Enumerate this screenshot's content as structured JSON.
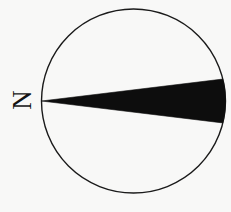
{
  "figure": {
    "kind": "rose-diagram",
    "background_color": "#f8f8f7",
    "stroke_color": "#1a1a1a",
    "fill_color": "#0d0d0d",
    "width": 231,
    "height": 212
  },
  "labels": {
    "north": "N"
  },
  "chart_data": {
    "type": "pie",
    "title": "",
    "subtitle": "",
    "xlabel": "",
    "ylabel": "",
    "legend": [],
    "grid": false,
    "circle": {
      "center_x": 133.5,
      "center_y": 101,
      "radius": 92,
      "stroke_width": 1.4,
      "fill": "none"
    },
    "orientation": {
      "north_at_degrees": 180,
      "note": "N label placed at left side of circle; rotated 90 degrees counter-clockwise"
    },
    "categories": [
      "sector"
    ],
    "values": [
      27
    ],
    "annotations": [
      "N"
    ],
    "sectors": [
      {
        "name": "primary-sector",
        "apex_x": 41.5,
        "apex_y": 101,
        "start_angle_deg": -13.8,
        "end_angle_deg": 13.8,
        "span_deg": 27.6,
        "fill": "#0d0d0d",
        "radius": 92
      }
    ]
  }
}
